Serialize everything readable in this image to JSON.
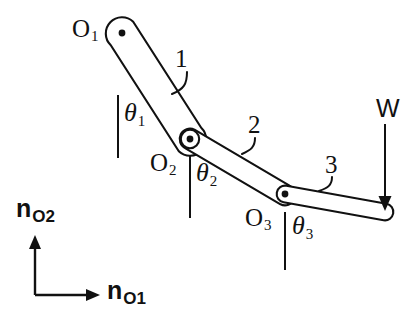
{
  "figure": {
    "type": "mechanism-diagram",
    "background_color": "#ffffff",
    "stroke_color": "#111111"
  },
  "joints": [
    {
      "id": "O1",
      "label": "O",
      "subscript": "1",
      "x": 122,
      "y": 33,
      "label_x": 72,
      "label_y": 16
    },
    {
      "id": "O2",
      "label": "O",
      "subscript": "2",
      "x": 190,
      "y": 139,
      "label_x": 150,
      "label_y": 150
    },
    {
      "id": "O3",
      "label": "O",
      "subscript": "3",
      "x": 285,
      "y": 194,
      "label_x": 245,
      "label_y": 205
    }
  ],
  "links": [
    {
      "id": "link1",
      "label": "1",
      "label_x": 175,
      "label_y": 46
    },
    {
      "id": "link2",
      "label": "2",
      "label_x": 248,
      "label_y": 112
    },
    {
      "id": "link3",
      "label": "3",
      "label_x": 325,
      "label_y": 152
    }
  ],
  "angles": [
    {
      "id": "theta1",
      "label": "θ",
      "subscript": "1",
      "label_x": 124,
      "label_y": 100
    },
    {
      "id": "theta2",
      "label": "θ",
      "subscript": "2",
      "label_x": 196,
      "label_y": 160
    },
    {
      "id": "theta3",
      "label": "θ",
      "subscript": "3",
      "label_x": 292,
      "label_y": 213
    }
  ],
  "load": {
    "id": "W",
    "label": "W",
    "label_x": 376,
    "label_y": 96,
    "arrow_x": 385,
    "arrow_top_y": 124,
    "arrow_tip_y": 210
  },
  "frame": {
    "origin_x": 35,
    "origin_y": 295,
    "vertical_axis": {
      "id": "nO2",
      "label": "n",
      "subscript": "O2",
      "label_x": 16,
      "label_y": 196,
      "tip_y": 236
    },
    "horizontal_axis": {
      "id": "nO1",
      "label": "n",
      "subscript": "O1",
      "label_x": 107,
      "label_y": 278,
      "tip_x": 100
    }
  }
}
